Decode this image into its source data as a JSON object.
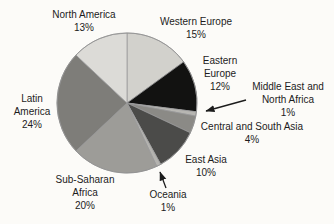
{
  "chart_data": {
    "type": "pie",
    "title": "",
    "start_angle": "12-o-clock",
    "direction": "clockwise",
    "outline_color": "#98989a",
    "arrow_color": "#1c1c1c",
    "segments": [
      {
        "id": "western_europe",
        "label": "Western Europe",
        "pct": 15,
        "color": "#d2d1cc"
      },
      {
        "id": "eastern_europe",
        "label": "Eastern Europe",
        "pct": 12,
        "color": "#121211"
      },
      {
        "id": "middle_east_north_africa",
        "label": "Middle East and North Africa",
        "pct": 1,
        "color": "#b7b6b2"
      },
      {
        "id": "central_south_asia",
        "label": "Central and South Asia",
        "pct": 4,
        "color": "#8b8a86"
      },
      {
        "id": "east_asia",
        "label": "East Asia",
        "pct": 10,
        "color": "#4b4b49"
      },
      {
        "id": "oceania",
        "label": "Oceania",
        "pct": 1,
        "color": "#b4b3af"
      },
      {
        "id": "sub_saharan_africa",
        "label": "Sub-Saharan Africa",
        "pct": 20,
        "color": "#9d9c98"
      },
      {
        "id": "latin_america",
        "label": "Latin America",
        "pct": 24,
        "color": "#7e7d79"
      },
      {
        "id": "north_america",
        "label": "North America",
        "pct": 13,
        "color": "#dcdbd7"
      }
    ],
    "callouts": {
      "north_america": [
        "North America",
        "13%"
      ],
      "western_europe": [
        "Western Europe",
        "15%"
      ],
      "eastern_europe": [
        "Eastern",
        "Europe",
        "12%"
      ],
      "middle_east_north_africa": [
        "Middle East and",
        "North Africa",
        "1%"
      ],
      "central_south_asia": [
        "Central and South Asia",
        "4%"
      ],
      "east_asia": [
        "East Asia",
        "10%"
      ],
      "oceania": [
        "Oceania",
        "1%"
      ],
      "sub_saharan_africa": [
        "Sub-Saharan",
        "Africa",
        "20%"
      ],
      "latin_america": [
        "Latin",
        "America",
        "24%"
      ]
    }
  }
}
